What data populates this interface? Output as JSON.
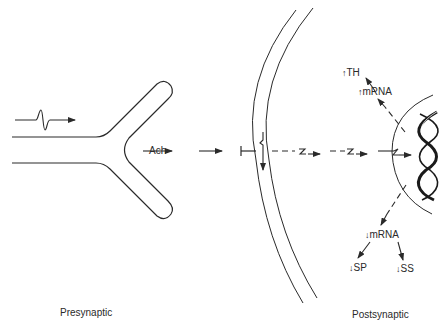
{
  "diagram": {
    "type": "synapse-signaling-schematic",
    "labels": {
      "neurotransmitter": "Ach",
      "presynaptic": "Presynaptic",
      "postsynaptic": "Postsynaptic",
      "th": "TH",
      "mrna_up": "mRNA",
      "mrna_down": "mRNA",
      "sp": "SP",
      "ss": "SS"
    },
    "indicators": {
      "up": "↑",
      "down": "↓"
    },
    "regions": [
      "presynaptic-terminal",
      "synaptic-cleft",
      "postsynaptic-membrane",
      "nucleus",
      "dna-helix"
    ],
    "stroke_color": "#2a2a2a"
  }
}
